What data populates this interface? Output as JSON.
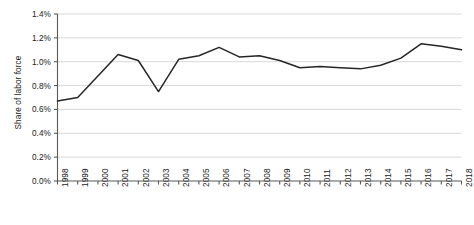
{
  "chart_data": {
    "type": "line",
    "title": "",
    "xlabel": "",
    "ylabel": "Share of labor force",
    "categories": [
      "1998",
      "1999",
      "2000",
      "2001",
      "2002",
      "2003",
      "2004",
      "2005",
      "2006",
      "2007",
      "2008",
      "2009",
      "2010",
      "2011",
      "2012",
      "2013",
      "2014",
      "2015",
      "2016",
      "2017",
      "2018"
    ],
    "values": [
      0.67,
      0.7,
      0.88,
      1.06,
      1.01,
      0.75,
      1.02,
      1.05,
      1.12,
      1.04,
      1.05,
      1.01,
      0.95,
      0.96,
      0.95,
      0.94,
      0.97,
      1.03,
      1.15,
      1.13,
      1.1
    ],
    "ylim": [
      0.0,
      1.4
    ],
    "ytick_values": [
      0.0,
      0.2,
      0.4,
      0.6,
      0.8,
      1.0,
      1.2,
      1.4
    ],
    "ytick_labels": [
      "0.0%",
      "0.2%",
      "0.4%",
      "0.6%",
      "0.8%",
      "1.0%",
      "1.2%",
      "1.4%"
    ],
    "grid": true,
    "grid_axis": "y",
    "legend": false,
    "series": [
      {
        "name": "Share of labor force",
        "values": [
          0.67,
          0.7,
          0.88,
          1.06,
          1.01,
          0.75,
          1.02,
          1.05,
          1.12,
          1.04,
          1.05,
          1.01,
          0.95,
          0.96,
          0.95,
          0.94,
          0.97,
          1.03,
          1.15,
          1.13,
          1.1
        ]
      }
    ],
    "colors": {
      "line": "#262626",
      "grid": "#d9d9d9",
      "axis": "#595959",
      "text": "#1a1a1a",
      "background": "#ffffff"
    }
  }
}
